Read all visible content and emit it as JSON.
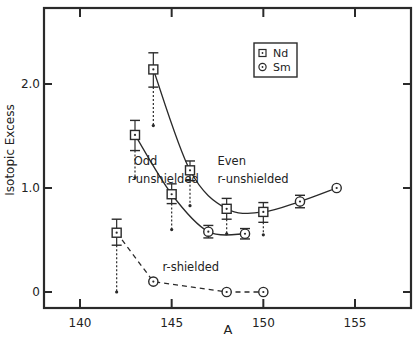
{
  "chart_data": {
    "type": "scatter",
    "title": "",
    "xlabel": "A",
    "ylabel": "Isotopic Excess",
    "xlim": [
      138,
      158
    ],
    "ylim": [
      -0.15,
      2.7
    ],
    "x_ticks": [
      140,
      145,
      150,
      155
    ],
    "x_tick_labels": [
      "140",
      "145",
      "150",
      "155"
    ],
    "y_ticks": [
      0,
      1.0,
      2.0
    ],
    "y_tick_labels": [
      "0",
      "1.0",
      "2.0"
    ],
    "grid": false,
    "legend": {
      "position": "upper right",
      "entries": [
        {
          "label": "Nd",
          "marker": "dotted-square"
        },
        {
          "label": "Sm",
          "marker": "dotted-circle"
        }
      ]
    },
    "annotations": [
      {
        "text": "Odd",
        "x": 142.6,
        "y": 1.22
      },
      {
        "text": "r-unshielded",
        "x": 142.6,
        "y": 1.05
      },
      {
        "text": "Even",
        "x": 147.5,
        "y": 1.22
      },
      {
        "text": "r-unshielded",
        "x": 147.5,
        "y": 1.05
      },
      {
        "text": "r-shielded",
        "x": 144.5,
        "y": 0.2
      }
    ],
    "series": [
      {
        "name": "Nd",
        "marker": "square",
        "points": [
          {
            "x": 142,
            "y": 0.57,
            "err_hi": 0.7,
            "err_lo": 0.45,
            "lower_limit": 0.0
          },
          {
            "x": 143,
            "y": 1.51,
            "err_hi": 1.65,
            "err_lo": 1.36,
            "lower_limit": 1.1
          },
          {
            "x": 144,
            "y": 2.14,
            "err_hi": 2.3,
            "err_lo": 1.97,
            "lower_limit": 1.6
          },
          {
            "x": 145,
            "y": 0.94,
            "err_hi": 1.04,
            "err_lo": 0.85,
            "lower_limit": 0.6
          },
          {
            "x": 146,
            "y": 1.17,
            "err_hi": 1.26,
            "err_lo": 1.07,
            "lower_limit": 0.83
          },
          {
            "x": 148,
            "y": 0.8,
            "err_hi": 0.9,
            "err_lo": 0.7,
            "lower_limit": 0.56
          },
          {
            "x": 150,
            "y": 0.77,
            "err_hi": 0.86,
            "err_lo": 0.67,
            "lower_limit": 0.55
          }
        ]
      },
      {
        "name": "Sm",
        "marker": "circle",
        "points": [
          {
            "x": 144,
            "y": 0.1
          },
          {
            "x": 147,
            "y": 0.58,
            "err_hi": 0.64,
            "err_lo": 0.52
          },
          {
            "x": 148,
            "y": 0.0
          },
          {
            "x": 149,
            "y": 0.56,
            "err_hi": 0.61,
            "err_lo": 0.51
          },
          {
            "x": 150,
            "y": 0.0
          },
          {
            "x": 152,
            "y": 0.87,
            "err_hi": 0.93,
            "err_lo": 0.81
          },
          {
            "x": 154,
            "y": 1.0
          }
        ]
      }
    ],
    "curves": [
      {
        "name": "odd r-unshielded",
        "style": "solid",
        "points": [
          [
            143,
            1.51
          ],
          [
            145,
            0.94
          ],
          [
            147,
            0.58
          ],
          [
            149,
            0.56
          ]
        ]
      },
      {
        "name": "even r-unshielded",
        "style": "solid",
        "points": [
          [
            144,
            2.14
          ],
          [
            146,
            1.17
          ],
          [
            148,
            0.8
          ],
          [
            150,
            0.77
          ],
          [
            152,
            0.87
          ],
          [
            154,
            1.0
          ]
        ]
      },
      {
        "name": "r-shielded",
        "style": "dashed",
        "points": [
          [
            142,
            0.57
          ],
          [
            144,
            0.1
          ],
          [
            148,
            0.0
          ],
          [
            150,
            0.0
          ]
        ]
      }
    ]
  }
}
